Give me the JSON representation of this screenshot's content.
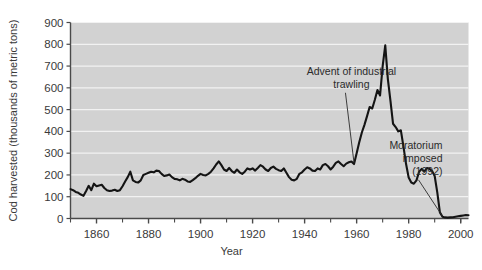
{
  "chart_data": {
    "type": "line",
    "title": "",
    "xlabel": "Year",
    "ylabel": "Cod harvested (thousands of metric tons)",
    "xlim": [
      1850,
      2003
    ],
    "ylim": [
      0,
      900
    ],
    "grid": true,
    "legend": "none",
    "plot_bg": "#d2d2d2",
    "gridline_color": "#f2f2f2",
    "line_color": "#141414",
    "axis_color": "#4a4a4a",
    "y_ticks": [
      0,
      100,
      200,
      300,
      400,
      500,
      600,
      700,
      800,
      900
    ],
    "y_tick_labels": [
      "0",
      "100",
      "200",
      "300",
      "400",
      "500",
      "600",
      "700",
      "800",
      "900"
    ],
    "x_ticks": [
      1860,
      1880,
      1900,
      1920,
      1940,
      1960,
      1980,
      2000
    ],
    "x_tick_labels": [
      "1860",
      "1880",
      "1900",
      "1920",
      "1940",
      "1960",
      "1980",
      "2000"
    ],
    "x_minor_ticks": [
      1850,
      1870,
      1890,
      1910,
      1930,
      1950,
      1970,
      1990,
      2000
    ],
    "annotations": [
      {
        "id": "advent-trawling",
        "lines": [
          "Advent of industrial",
          "trawling"
        ],
        "text": "Advent of industrial trawling",
        "text_x": 1958,
        "text_y": 660,
        "point_x": 1959,
        "point_y": 255
      },
      {
        "id": "moratorium",
        "lines": [
          "Moratorium",
          "imposed",
          "(1992)"
        ],
        "text": "Moratorium imposed (1992)",
        "text_x": 1993,
        "text_y": 320,
        "point_x": 1993,
        "point_y": 10
      }
    ],
    "x": [
      1850,
      1851,
      1852,
      1853,
      1854,
      1855,
      1856,
      1857,
      1858,
      1859,
      1860,
      1861,
      1862,
      1863,
      1864,
      1865,
      1866,
      1867,
      1868,
      1869,
      1870,
      1871,
      1872,
      1873,
      1874,
      1875,
      1876,
      1877,
      1878,
      1879,
      1880,
      1881,
      1882,
      1883,
      1884,
      1885,
      1886,
      1887,
      1888,
      1889,
      1890,
      1891,
      1892,
      1893,
      1894,
      1895,
      1896,
      1897,
      1898,
      1899,
      1900,
      1901,
      1902,
      1903,
      1904,
      1905,
      1906,
      1907,
      1908,
      1909,
      1910,
      1911,
      1912,
      1913,
      1914,
      1915,
      1916,
      1917,
      1918,
      1919,
      1920,
      1921,
      1922,
      1923,
      1924,
      1925,
      1926,
      1927,
      1928,
      1929,
      1930,
      1931,
      1932,
      1933,
      1934,
      1935,
      1936,
      1937,
      1938,
      1939,
      1940,
      1941,
      1942,
      1943,
      1944,
      1945,
      1946,
      1947,
      1948,
      1949,
      1950,
      1951,
      1952,
      1953,
      1954,
      1955,
      1956,
      1957,
      1958,
      1959,
      1960,
      1961,
      1962,
      1963,
      1964,
      1965,
      1966,
      1967,
      1968,
      1969,
      1970,
      1971,
      1972,
      1973,
      1974,
      1975,
      1976,
      1977,
      1978,
      1979,
      1980,
      1981,
      1982,
      1983,
      1984,
      1985,
      1986,
      1987,
      1988,
      1989,
      1990,
      1991,
      1992,
      1993,
      1994,
      1995,
      1996,
      1997,
      1998,
      1999,
      2000,
      2001,
      2002,
      2003
    ],
    "values": [
      135,
      130,
      122,
      118,
      110,
      104,
      126,
      150,
      130,
      160,
      148,
      152,
      155,
      140,
      130,
      126,
      128,
      132,
      126,
      130,
      148,
      170,
      190,
      215,
      175,
      168,
      165,
      175,
      200,
      205,
      210,
      215,
      212,
      220,
      218,
      205,
      195,
      198,
      202,
      190,
      182,
      180,
      175,
      182,
      178,
      170,
      168,
      176,
      185,
      196,
      205,
      200,
      198,
      205,
      215,
      230,
      248,
      262,
      245,
      225,
      218,
      232,
      218,
      210,
      225,
      212,
      205,
      215,
      230,
      225,
      230,
      220,
      232,
      245,
      238,
      225,
      218,
      232,
      238,
      228,
      222,
      218,
      230,
      210,
      190,
      178,
      175,
      182,
      205,
      212,
      225,
      235,
      230,
      220,
      218,
      230,
      225,
      245,
      250,
      240,
      225,
      238,
      255,
      262,
      250,
      240,
      252,
      258,
      262,
      250,
      300,
      350,
      395,
      430,
      470,
      512,
      505,
      545,
      590,
      565,
      700,
      795,
      640,
      540,
      435,
      420,
      400,
      405,
      330,
      250,
      188,
      165,
      160,
      175,
      215,
      228,
      215,
      232,
      228,
      218,
      195,
      120,
      28,
      8,
      5,
      4,
      5,
      6,
      8,
      10,
      12,
      14,
      16,
      15
    ]
  }
}
